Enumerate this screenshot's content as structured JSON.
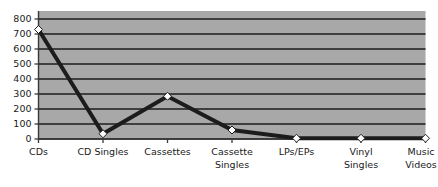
{
  "chart_data": {
    "type": "line",
    "title": "",
    "subtitle": "",
    "xlabel": "",
    "ylabel": "",
    "categories": [
      "CDs",
      "CD Singles",
      "Cassettes",
      "Cassette Singles",
      "LPs/EPs",
      "Vinyl Singles",
      "Music Videos"
    ],
    "category_lines": [
      [
        "CDs"
      ],
      [
        "CD Singles"
      ],
      [
        "Cassettes"
      ],
      [
        "Cassette",
        "Singles"
      ],
      [
        "LPs/EPs"
      ],
      [
        "Vinyl",
        "Singles"
      ],
      [
        "Music",
        "Videos"
      ]
    ],
    "values": [
      730,
      35,
      285,
      60,
      5,
      5,
      5
    ],
    "series": [
      {
        "name": "",
        "values": [
          730,
          35,
          285,
          60,
          5,
          5,
          5
        ]
      }
    ],
    "ylim": [
      0,
      800
    ],
    "yticks": [
      0,
      100,
      200,
      300,
      400,
      500,
      600,
      700,
      800
    ],
    "ytick_labels": [
      "0",
      "100",
      "200",
      "300",
      "400",
      "500",
      "600",
      "700",
      "800"
    ],
    "grid": true,
    "grid_axis": "y",
    "legend": false,
    "legend_position": "none",
    "marker": "diamond",
    "marker_face_color": "#ffffff",
    "marker_edge_color": "#1c1c1c",
    "line_color": "#1c1c1c",
    "line_width": 4,
    "plot_background_color": "#a8a8a8",
    "figure_background_color": "#ffffff",
    "gridline_color": "#1c1c1c",
    "axis_color": "#3a3a3a",
    "tick_label_color": "#1a1a1a"
  }
}
